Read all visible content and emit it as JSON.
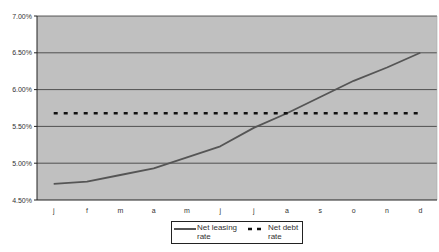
{
  "chart_data": {
    "type": "line",
    "title": "",
    "xlabel": "",
    "ylabel": "",
    "categories": [
      "j",
      "f",
      "m",
      "a",
      "m",
      "j",
      "j",
      "a",
      "s",
      "o",
      "n",
      "d"
    ],
    "series": [
      {
        "name": "Net leasing rate",
        "style": "solid",
        "color": "#555555",
        "values": [
          4.72,
          4.75,
          4.84,
          4.93,
          5.08,
          5.23,
          5.48,
          5.68,
          5.9,
          6.12,
          6.3,
          6.5
        ]
      },
      {
        "name": "Net debt rate",
        "style": "dashed",
        "color": "#111111",
        "values": [
          5.68,
          5.68,
          5.68,
          5.68,
          5.68,
          5.68,
          5.68,
          5.68,
          5.68,
          5.68,
          5.68,
          5.68
        ]
      }
    ],
    "yticks": [
      "7.00%",
      "6.50%",
      "6.00%",
      "5.50%",
      "5.00%",
      "4.50%"
    ],
    "ylim": [
      4.5,
      7.0
    ],
    "grid": true,
    "legend_position": "bottom",
    "plot_background": "#c0c0c0"
  },
  "legend": {
    "leasing_line1": "Net leasing",
    "leasing_line2": "rate",
    "debt_line1": "Net debt",
    "debt_line2": "rate"
  }
}
